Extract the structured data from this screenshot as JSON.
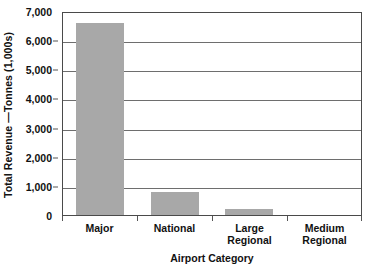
{
  "chart_data": {
    "type": "bar",
    "title": "",
    "categories": [
      "Major",
      "National",
      "Large Regional",
      "Medium Regional"
    ],
    "values": [
      6600,
      800,
      190,
      0
    ],
    "series": [
      {
        "name": "Total Revenue",
        "values": [
          6600,
          800,
          190,
          0
        ]
      }
    ],
    "xlabel": "Airport Category",
    "ylabel": "Total Revenue —Tonnes (1,000s)",
    "ylim": [
      0,
      7000
    ],
    "ytick_values": [
      0,
      1000,
      2000,
      3000,
      4000,
      5000,
      6000,
      7000
    ],
    "ytick_labels": [
      "0",
      "1,000",
      "2,000",
      "3,000",
      "4,000",
      "5,000",
      "6,000",
      "7,000"
    ],
    "grid": true,
    "grid_axis": "y",
    "legend": false,
    "bar_color": "#a8a8a8",
    "axis_color": "#4a4a4a",
    "background_color": "#ffffff"
  },
  "axes": {
    "y_title": "Total Revenue —Tonnes (1,000s)",
    "x_title": "Airport Category"
  },
  "category_label_lines": [
    [
      "Major"
    ],
    [
      "National"
    ],
    [
      "Large",
      "Regional"
    ],
    [
      "Medium",
      "Regional"
    ]
  ]
}
